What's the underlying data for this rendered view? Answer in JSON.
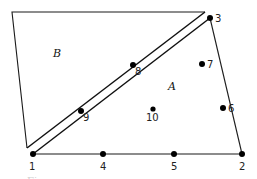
{
  "diagram": {
    "regions": [
      {
        "id": "B",
        "label": "B",
        "label_pos": [
          57,
          56
        ]
      },
      {
        "id": "A",
        "label": "A",
        "label_pos": [
          171,
          89
        ]
      }
    ],
    "region_B_polygon": [
      [
        12,
        12
      ],
      [
        205,
        12
      ],
      [
        27,
        148
      ]
    ],
    "triangle_A": [
      [
        33,
        154
      ],
      [
        242,
        154
      ],
      [
        210,
        18
      ]
    ],
    "nodes": [
      {
        "id": "1",
        "label": "1",
        "x": 33,
        "y": 154,
        "label_x": 30,
        "label_y": 169
      },
      {
        "id": "2",
        "label": "2",
        "x": 242,
        "y": 154,
        "label_x": 239,
        "label_y": 169
      },
      {
        "id": "3",
        "label": "3",
        "x": 210,
        "y": 18,
        "label_x": 216,
        "label_y": 22
      },
      {
        "id": "4",
        "label": "4",
        "x": 103,
        "y": 154,
        "label_x": 100,
        "label_y": 169
      },
      {
        "id": "5",
        "label": "5",
        "x": 174,
        "y": 154,
        "label_x": 171,
        "label_y": 169
      },
      {
        "id": "6",
        "label": "6",
        "x": 223,
        "y": 108,
        "label_x": 228,
        "label_y": 112
      },
      {
        "id": "7",
        "label": "7",
        "x": 202,
        "y": 64,
        "label_x": 208,
        "label_y": 68
      },
      {
        "id": "8",
        "label": "8",
        "x": 133,
        "y": 65,
        "label_x": 135,
        "label_y": 76
      },
      {
        "id": "9",
        "label": "9",
        "x": 81,
        "y": 111,
        "label_x": 84,
        "label_y": 121
      },
      {
        "id": "10",
        "label": "10",
        "x": 153,
        "y": 109,
        "label_x": 147,
        "label_y": 121
      }
    ],
    "caption": "Fig."
  }
}
